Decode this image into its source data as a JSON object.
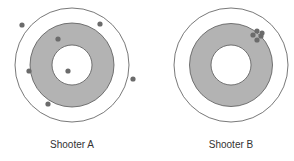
{
  "colors": {
    "ring": "#b3b3b3",
    "outline": "#555555",
    "shot": "#6b6b6b",
    "background": "#ffffff"
  },
  "targets": [
    {
      "label": "Shooter A",
      "center": [
        72,
        65
      ],
      "radii": {
        "outer": 57,
        "ring": 42,
        "inner": 20
      },
      "shots": [
        [
          22,
          25
        ],
        [
          100,
          24
        ],
        [
          58,
          39
        ],
        [
          29,
          71
        ],
        [
          68,
          71
        ],
        [
          133,
          79
        ],
        [
          48,
          104
        ]
      ]
    },
    {
      "label": "Shooter B",
      "center": [
        231,
        65
      ],
      "radii": {
        "outer": 57,
        "ring": 41.5,
        "inner": 20
      },
      "shots": [
        [
          253,
          35
        ],
        [
          257,
          31
        ],
        [
          261,
          36
        ],
        [
          257,
          40
        ],
        [
          262,
          33
        ]
      ]
    }
  ]
}
